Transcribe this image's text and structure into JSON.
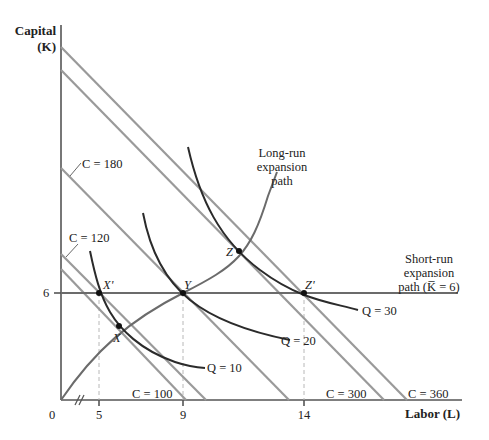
{
  "figure": {
    "y_axis": {
      "title_line1": "Capital",
      "title_line2": "(K)"
    },
    "x_axis": {
      "title": "Labor (L)"
    },
    "origin_label": "0",
    "x_ticks": [
      "5",
      "9",
      "14"
    ],
    "y_ticks": [
      "6"
    ],
    "isocosts": [
      {
        "label": "C = 100",
        "cost": 100
      },
      {
        "label": "C = 120",
        "cost": 120
      },
      {
        "label": "C = 180",
        "cost": 180
      },
      {
        "label": "C = 300",
        "cost": 300
      },
      {
        "label": "C = 360",
        "cost": 360
      }
    ],
    "isoquants": [
      {
        "label": "Q = 10",
        "q": 10
      },
      {
        "label": "Q = 20",
        "q": 20
      },
      {
        "label": "Q = 30",
        "q": 30
      }
    ],
    "points": [
      {
        "label": "X'",
        "L": 5,
        "K": 6
      },
      {
        "label": "X"
      },
      {
        "label": "Y",
        "L": 9,
        "K": 6
      },
      {
        "label": "Z"
      },
      {
        "label": "Z'",
        "L": 14,
        "K": 6
      }
    ],
    "long_run_path": {
      "line1": "Long-run",
      "line2": "expansion",
      "line3": "path"
    },
    "short_run_path": {
      "line1": "Short-run",
      "line2": "expansion",
      "line3": "path (K̅ = 6)"
    },
    "colors": {
      "isocost": "#9a9a9a",
      "isoquant": "#2b2b2b",
      "expansion_path": "#6b6b6b",
      "axis": "#555555"
    }
  }
}
